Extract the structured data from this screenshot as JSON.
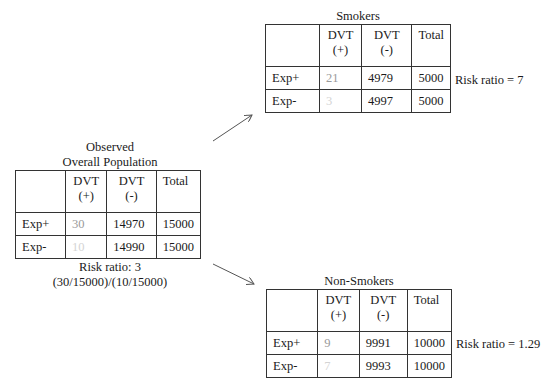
{
  "overall": {
    "title_line1": "Observed",
    "title_line2": "Overall Population",
    "headers": [
      "",
      "DVT",
      "DVT",
      "Total"
    ],
    "headers_sub": [
      "",
      "(+)",
      "(-)",
      ""
    ],
    "rows": [
      {
        "label": "Exp+",
        "dvt_pos": "30",
        "dvt_neg": "14970",
        "total": "15000"
      },
      {
        "label": "Exp-",
        "dvt_pos": "10",
        "dvt_neg": "14990",
        "total": "15000"
      }
    ],
    "risk_ratio_line1": "Risk ratio: 3",
    "risk_ratio_line2": "(30/15000)/(10/15000)"
  },
  "smokers": {
    "title": "Smokers",
    "headers": [
      "",
      "DVT",
      "DVT",
      "Total"
    ],
    "headers_sub": [
      "",
      "(+)",
      "(-)",
      ""
    ],
    "rows": [
      {
        "label": "Exp+",
        "dvt_pos": "21",
        "dvt_neg": "4979",
        "total": "5000"
      },
      {
        "label": "Exp-",
        "dvt_pos": "3",
        "dvt_neg": "4997",
        "total": "5000"
      }
    ],
    "risk_ratio": "Risk ratio = 7"
  },
  "non_smokers": {
    "title": "Non-Smokers",
    "headers": [
      "",
      "DVT",
      "DVT",
      "Total"
    ],
    "headers_sub": [
      "",
      "(+)",
      "(-)",
      ""
    ],
    "rows": [
      {
        "label": "Exp+",
        "dvt_pos": "9",
        "dvt_neg": "9991",
        "total": "10000"
      },
      {
        "label": "Exp-",
        "dvt_pos": "7",
        "dvt_neg": "9993",
        "total": "10000"
      }
    ],
    "risk_ratio": "Risk ratio = 1.29"
  },
  "colors": {
    "line": "#333333",
    "arrow": "#555555",
    "faint_exp_pos": "#9a9a9a",
    "faint_exp_neg": "#d4d4d4"
  }
}
